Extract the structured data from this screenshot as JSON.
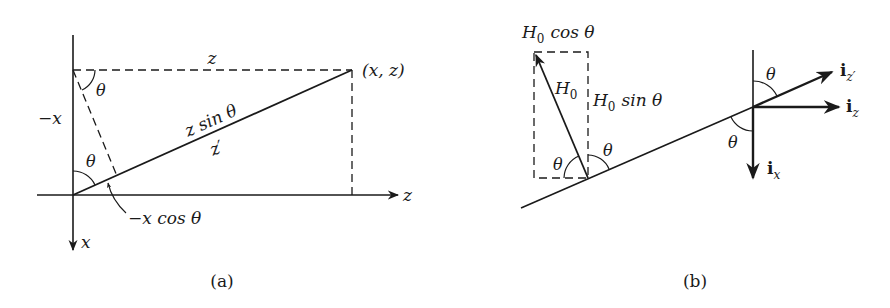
{
  "figure_a": {
    "caption": "(a)",
    "labels": {
      "top_z": "z",
      "point": "(x, z)",
      "neg_x": "−x",
      "theta_top": "θ",
      "theta_bottom": "θ",
      "z_sin_theta": "z sin θ",
      "z_prime": "z′",
      "neg_x_cos_theta": "−x cos θ",
      "z_axis": "z",
      "x_axis": "x"
    }
  },
  "figure_b": {
    "caption": "(b)",
    "labels": {
      "h0_cos_theta_H": "H",
      "h0_cos_theta_sub": "0",
      "h0_cos_theta_rest": "cos θ",
      "h0_H": "H",
      "h0_sub": "0",
      "h0_sin_theta_H": "H",
      "h0_sin_theta_sub": "0",
      "h0_sin_theta_rest": "sin θ",
      "theta_left": "θ",
      "theta_right": "θ",
      "theta_upper": "θ",
      "theta_lower": "θ",
      "iz_prime_i": "i",
      "iz_prime_sub": "z′",
      "iz_i": "i",
      "iz_sub": "z",
      "ix_i": "i",
      "ix_sub": "x"
    }
  },
  "colors": {
    "ink": "#1a1a1a",
    "background": "#ffffff"
  }
}
